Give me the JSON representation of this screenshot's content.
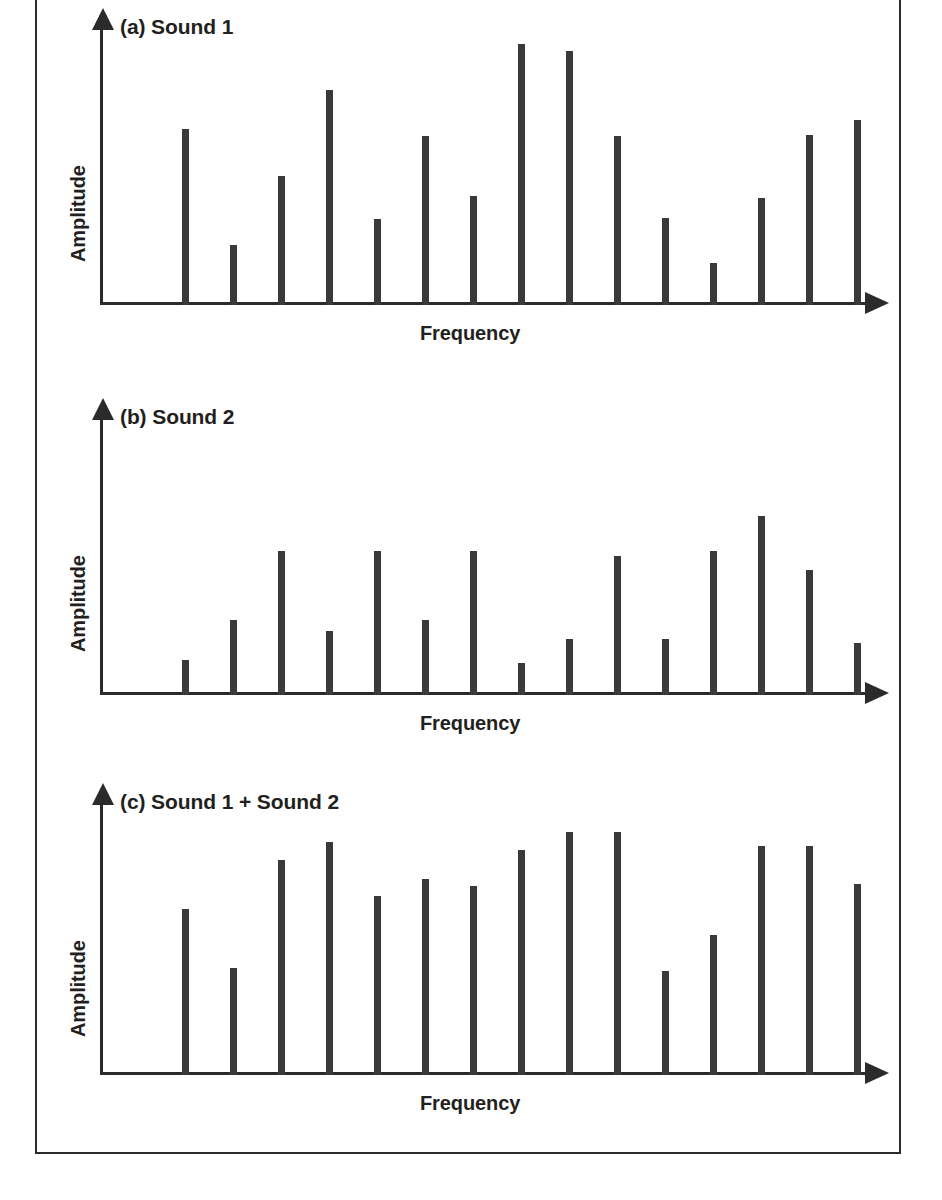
{
  "figure": {
    "border_color": "#2b2b2b",
    "bar_color": "#3a3a3a",
    "text_color": "#231f20",
    "axis_x_label": "Frequency",
    "axis_y_label": "Amplitude"
  },
  "panels": [
    {
      "caption": "(a) Sound 1",
      "xlabel": "Frequency",
      "ylabel": "Amplitude"
    },
    {
      "caption": "(b) Sound 2",
      "xlabel": "Frequency",
      "ylabel": "Amplitude"
    },
    {
      "caption": "(c) Sound 1 + Sound 2",
      "xlabel": "Frequency",
      "ylabel": "Amplitude"
    }
  ],
  "chart_data": [
    {
      "type": "bar",
      "title": "(a) Sound 1",
      "xlabel": "Frequency",
      "ylabel": "Amplitude",
      "grid": false,
      "legend": "none",
      "x_tick_labels": [],
      "y_tick_labels": [],
      "ylim": [
        0,
        220
      ],
      "categories": [
        "f1",
        "f2",
        "f3",
        "f4",
        "f5",
        "f6",
        "f7",
        "f8",
        "f9",
        "f10",
        "f11",
        "f12",
        "f13",
        "f14",
        "f15"
      ],
      "values": [
        141,
        48,
        103,
        172,
        69,
        135,
        87,
        209,
        203,
        135,
        70,
        34,
        86,
        136,
        148
      ]
    },
    {
      "type": "bar",
      "title": "(b) Sound 2",
      "xlabel": "Frequency",
      "ylabel": "Amplitude",
      "grid": false,
      "legend": "none",
      "x_tick_labels": [],
      "y_tick_labels": [],
      "ylim": [
        0,
        220
      ],
      "categories": [
        "f1",
        "f2",
        "f3",
        "f4",
        "f5",
        "f6",
        "f7",
        "f8",
        "f9",
        "f10",
        "f11",
        "f12",
        "f13",
        "f14",
        "f15"
      ],
      "values": [
        28,
        60,
        115,
        51,
        115,
        60,
        115,
        26,
        45,
        111,
        45,
        115,
        143,
        100,
        42
      ]
    },
    {
      "type": "bar",
      "title": "(c) Sound 1 + Sound 2",
      "xlabel": "Frequency",
      "ylabel": "Amplitude",
      "grid": false,
      "legend": "none",
      "x_tick_labels": [],
      "y_tick_labels": [],
      "ylim": [
        0,
        260
      ],
      "categories": [
        "f1",
        "f2",
        "f3",
        "f4",
        "f5",
        "f6",
        "f7",
        "f8",
        "f9",
        "f10",
        "f11",
        "f12",
        "f13",
        "f14",
        "f15"
      ],
      "values": [
        160,
        103,
        207,
        224,
        172,
        189,
        182,
        217,
        234,
        234,
        100,
        135,
        221,
        221,
        184
      ]
    }
  ]
}
